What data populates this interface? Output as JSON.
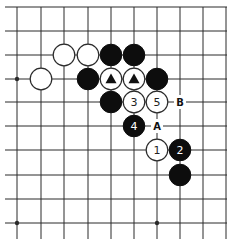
{
  "board": {
    "columns_x": [
      17,
      41,
      64,
      88,
      111,
      134,
      157,
      180,
      203,
      226
    ],
    "rows_y": [
      7,
      31,
      55,
      79,
      102,
      126,
      150,
      175,
      199,
      223
    ],
    "top_edge": true,
    "star_points": [
      [
        0,
        3
      ],
      [
        0,
        9
      ],
      [
        6,
        9
      ]
    ],
    "colors": {
      "line": "#2a2a2a",
      "black": "#0d0d0d",
      "white": "#ffffff"
    }
  },
  "stones": [
    {
      "color": "white",
      "col": 2,
      "row": 2,
      "mark": ""
    },
    {
      "color": "white",
      "col": 3,
      "row": 2,
      "mark": ""
    },
    {
      "color": "black",
      "col": 4,
      "row": 2,
      "mark": ""
    },
    {
      "color": "black",
      "col": 5,
      "row": 2,
      "mark": ""
    },
    {
      "color": "white",
      "col": 1,
      "row": 3,
      "mark": ""
    },
    {
      "color": "black",
      "col": 3,
      "row": 3,
      "mark": ""
    },
    {
      "color": "white",
      "col": 4,
      "row": 3,
      "mark": "triangle"
    },
    {
      "color": "white",
      "col": 5,
      "row": 3,
      "mark": "triangle"
    },
    {
      "color": "black",
      "col": 6,
      "row": 3,
      "mark": ""
    },
    {
      "color": "black",
      "col": 4,
      "row": 4,
      "mark": ""
    },
    {
      "color": "white",
      "col": 5,
      "row": 4,
      "mark": "3"
    },
    {
      "color": "white",
      "col": 6,
      "row": 4,
      "mark": "5"
    },
    {
      "color": "black",
      "col": 5,
      "row": 5,
      "mark": "4"
    },
    {
      "color": "white",
      "col": 6,
      "row": 6,
      "mark": "1"
    },
    {
      "color": "black",
      "col": 7,
      "row": 6,
      "mark": "2"
    },
    {
      "color": "black",
      "col": 7,
      "row": 7,
      "mark": ""
    }
  ],
  "labels": [
    {
      "text": "B",
      "col": 7,
      "row": 4
    },
    {
      "text": "A",
      "col": 6,
      "row": 5
    }
  ]
}
